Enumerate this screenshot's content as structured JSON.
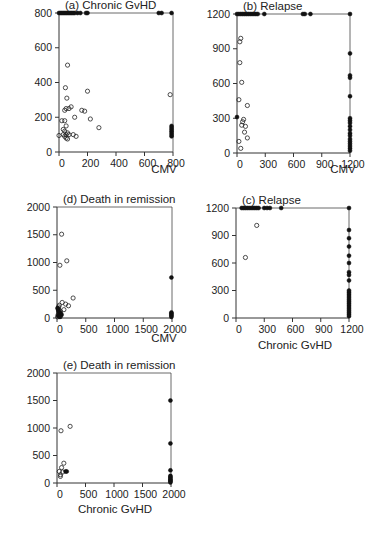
{
  "figure": {
    "width": 389,
    "height": 540
  },
  "chart_data": [
    {
      "id": "a",
      "type": "scatter",
      "title": "(a)  Chronic GvHD",
      "xlabel": "CMV",
      "ylabel": "",
      "xlim": [
        0,
        800
      ],
      "ylim": [
        0,
        800
      ],
      "xticks": [
        0,
        200,
        400,
        600,
        800
      ],
      "yticks": [
        0,
        200,
        400,
        600,
        800
      ],
      "grid": false,
      "frame": {
        "x0": 59,
        "x1": 173,
        "y0": 152,
        "y1": 13
      },
      "xlabel_pos": [
        164,
        173
      ],
      "open_points": [
        [
          60,
          500
        ],
        [
          45,
          370
        ],
        [
          55,
          310
        ],
        [
          200,
          350
        ],
        [
          50,
          250
        ],
        [
          70,
          250
        ],
        [
          85,
          260
        ],
        [
          40,
          240
        ],
        [
          160,
          240
        ],
        [
          180,
          235
        ],
        [
          20,
          180
        ],
        [
          40,
          180
        ],
        [
          110,
          200
        ],
        [
          220,
          190
        ],
        [
          280,
          140
        ],
        [
          50,
          150
        ],
        [
          30,
          130
        ],
        [
          40,
          120
        ],
        [
          60,
          110
        ],
        [
          30,
          100
        ],
        [
          50,
          100
        ],
        [
          70,
          100
        ],
        [
          100,
          100
        ],
        [
          120,
          90
        ],
        [
          40,
          90
        ],
        [
          50,
          80
        ],
        [
          60,
          75
        ],
        [
          0,
          95
        ],
        [
          780,
          330
        ]
      ],
      "censored_points": [
        [
          0,
          800
        ],
        [
          10,
          800
        ],
        [
          20,
          800
        ],
        [
          30,
          800
        ],
        [
          40,
          800
        ],
        [
          50,
          800
        ],
        [
          60,
          800
        ],
        [
          70,
          800
        ],
        [
          80,
          800
        ],
        [
          90,
          800
        ],
        [
          100,
          800
        ],
        [
          110,
          800
        ],
        [
          130,
          800
        ],
        [
          150,
          800
        ],
        [
          190,
          800
        ],
        [
          200,
          800
        ],
        [
          700,
          800
        ],
        [
          720,
          800
        ],
        [
          790,
          800
        ],
        [
          790,
          150
        ],
        [
          790,
          140
        ],
        [
          790,
          130
        ],
        [
          790,
          120
        ],
        [
          790,
          110
        ],
        [
          790,
          100
        ],
        [
          790,
          90
        ]
      ]
    },
    {
      "id": "b",
      "type": "scatter",
      "title": "(b)  Relapse",
      "xlabel": "CMV",
      "ylabel": "",
      "xlim": [
        0,
        1200
      ],
      "ylim": [
        0,
        1200
      ],
      "xticks": [
        0,
        300,
        600,
        900,
        1200
      ],
      "yticks": [
        0,
        300,
        600,
        900,
        1200
      ],
      "grid": false,
      "frame": {
        "x0": 237,
        "x1": 350,
        "y0": 153,
        "y1": 14
      },
      "xlabel_pos": [
        343,
        173
      ],
      "open_points": [
        [
          40,
          990
        ],
        [
          30,
          960
        ],
        [
          30,
          780
        ],
        [
          50,
          610
        ],
        [
          20,
          460
        ],
        [
          110,
          410
        ],
        [
          70,
          290
        ],
        [
          60,
          270
        ],
        [
          50,
          240
        ],
        [
          90,
          230
        ],
        [
          80,
          180
        ],
        [
          110,
          130
        ],
        [
          20,
          100
        ],
        [
          40,
          40
        ]
      ],
      "censored_points": [
        [
          0,
          1200
        ],
        [
          20,
          1200
        ],
        [
          40,
          1200
        ],
        [
          60,
          1200
        ],
        [
          80,
          1200
        ],
        [
          100,
          1200
        ],
        [
          120,
          1200
        ],
        [
          140,
          1200
        ],
        [
          160,
          1200
        ],
        [
          180,
          1200
        ],
        [
          200,
          1200
        ],
        [
          220,
          1200
        ],
        [
          290,
          1200
        ],
        [
          700,
          1200
        ],
        [
          720,
          1200
        ],
        [
          780,
          1200
        ],
        [
          1200,
          1200
        ],
        [
          1200,
          860
        ],
        [
          1200,
          670
        ],
        [
          1200,
          650
        ],
        [
          1200,
          490
        ],
        [
          1200,
          300
        ],
        [
          1200,
          280
        ],
        [
          1200,
          260
        ],
        [
          1200,
          230
        ],
        [
          1200,
          200
        ],
        [
          1200,
          170
        ],
        [
          1200,
          150
        ],
        [
          1200,
          120
        ],
        [
          1200,
          100
        ],
        [
          1200,
          80
        ],
        [
          1200,
          60
        ],
        [
          1200,
          40
        ],
        [
          1200,
          20
        ],
        [
          0,
          310
        ]
      ]
    },
    {
      "id": "d",
      "type": "scatter",
      "title": "(d)  Death in remission",
      "xlabel": "CMV",
      "ylabel": "",
      "xlim": [
        0,
        2000
      ],
      "ylim": [
        0,
        2000
      ],
      "xticks": [
        0,
        500,
        1000,
        1500,
        2000
      ],
      "yticks": [
        0,
        500,
        1000,
        1500,
        2000
      ],
      "grid": false,
      "frame": {
        "x0": 57,
        "x1": 172,
        "y0": 318,
        "y1": 207
      },
      "xlabel_pos": [
        164,
        342
      ],
      "open_points": [
        [
          80,
          1510
        ],
        [
          170,
          1030
        ],
        [
          50,
          950
        ],
        [
          280,
          360
        ],
        [
          90,
          280
        ],
        [
          150,
          250
        ],
        [
          200,
          220
        ],
        [
          120,
          150
        ],
        [
          40,
          230
        ],
        [
          30,
          200
        ],
        [
          20,
          170
        ],
        [
          40,
          140
        ],
        [
          60,
          120
        ],
        [
          30,
          100
        ],
        [
          50,
          80
        ],
        [
          20,
          60
        ],
        [
          40,
          40
        ],
        [
          60,
          30
        ],
        [
          10,
          20
        ]
      ],
      "censored_points": [
        [
          10,
          180
        ],
        [
          20,
          150
        ],
        [
          30,
          120
        ],
        [
          40,
          100
        ],
        [
          60,
          90
        ],
        [
          80,
          60
        ],
        [
          20,
          40
        ],
        [
          50,
          20
        ],
        [
          1990,
          730
        ],
        [
          1990,
          100
        ],
        [
          1990,
          80
        ],
        [
          1990,
          60
        ],
        [
          1990,
          40
        ],
        [
          1990,
          20
        ]
      ]
    },
    {
      "id": "c",
      "type": "scatter",
      "title": "(c)  Relapse",
      "xlabel": "Chronic GvHD",
      "ylabel": "",
      "xlim": [
        0,
        1200
      ],
      "ylim": [
        0,
        1200
      ],
      "xticks": [
        0,
        300,
        600,
        900,
        1200
      ],
      "yticks": [
        0,
        300,
        600,
        900,
        1200
      ],
      "grid": false,
      "frame": {
        "x0": 236,
        "x1": 349,
        "y0": 318,
        "y1": 208
      },
      "xlabel_pos": [
        295,
        349
      ],
      "open_points": [
        [
          220,
          1010
        ],
        [
          100,
          660
        ]
      ],
      "censored_points": [
        [
          60,
          1200
        ],
        [
          80,
          1200
        ],
        [
          100,
          1200
        ],
        [
          120,
          1200
        ],
        [
          140,
          1200
        ],
        [
          160,
          1200
        ],
        [
          180,
          1200
        ],
        [
          200,
          1200
        ],
        [
          220,
          1200
        ],
        [
          240,
          1200
        ],
        [
          300,
          1200
        ],
        [
          330,
          1200
        ],
        [
          360,
          1200
        ],
        [
          480,
          1200
        ],
        [
          1200,
          1200
        ],
        [
          1200,
          960
        ],
        [
          1200,
          870
        ],
        [
          1200,
          780
        ],
        [
          1200,
          680
        ],
        [
          1200,
          600
        ],
        [
          1200,
          500
        ],
        [
          1200,
          470
        ],
        [
          1200,
          410
        ],
        [
          1200,
          300
        ],
        [
          1200,
          280
        ],
        [
          1200,
          260
        ],
        [
          1200,
          240
        ],
        [
          1200,
          220
        ],
        [
          1200,
          200
        ],
        [
          1200,
          180
        ],
        [
          1200,
          160
        ],
        [
          1200,
          140
        ],
        [
          1200,
          120
        ],
        [
          1200,
          100
        ],
        [
          1200,
          80
        ],
        [
          1200,
          60
        ],
        [
          1200,
          40
        ],
        [
          1200,
          20
        ]
      ]
    },
    {
      "id": "e",
      "type": "scatter",
      "title": "(e)  Death in remission",
      "xlabel": "Chronic GvHD",
      "ylabel": "",
      "xlim": [
        0,
        2000
      ],
      "ylim": [
        0,
        2000
      ],
      "xticks": [
        0,
        500,
        1000,
        1500,
        2000
      ],
      "yticks": [
        0,
        500,
        1000,
        1500,
        2000
      ],
      "grid": false,
      "frame": {
        "x0": 57,
        "x1": 171,
        "y0": 483,
        "y1": 373
      },
      "xlabel_pos": [
        115,
        513
      ],
      "open_points": [
        [
          70,
          950
        ],
        [
          230,
          1030
        ],
        [
          120,
          360
        ],
        [
          80,
          280
        ],
        [
          40,
          210
        ],
        [
          100,
          200
        ],
        [
          60,
          150
        ],
        [
          60,
          120
        ]
      ],
      "censored_points": [
        [
          150,
          210
        ],
        [
          170,
          210
        ],
        [
          1990,
          1500
        ],
        [
          1990,
          720
        ],
        [
          1990,
          230
        ],
        [
          1990,
          130
        ],
        [
          1990,
          110
        ],
        [
          1990,
          90
        ],
        [
          1990,
          70
        ],
        [
          1990,
          50
        ],
        [
          1990,
          30
        ],
        [
          1990,
          10
        ]
      ]
    }
  ]
}
